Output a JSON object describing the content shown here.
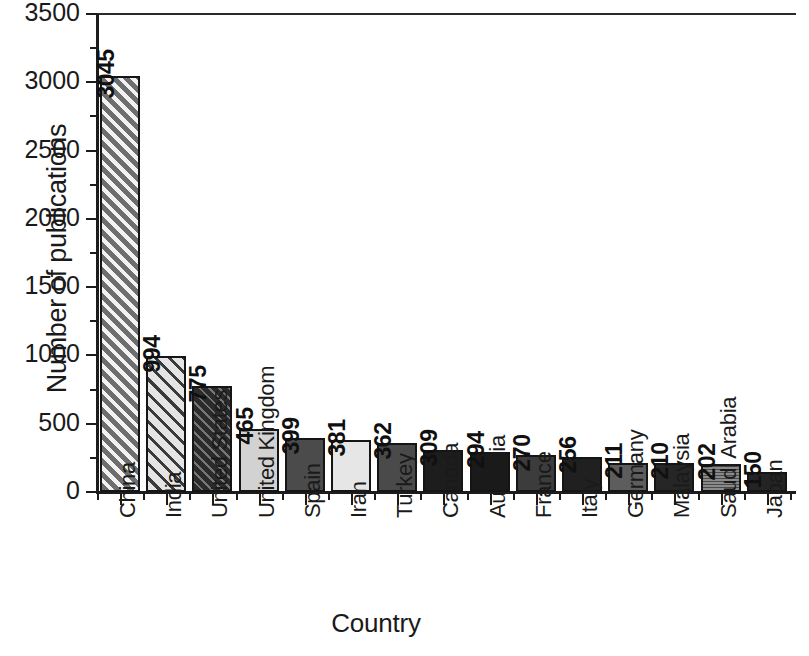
{
  "chart_data": {
    "type": "bar",
    "title": "",
    "xlabel": "Country",
    "ylabel": "Number of publications",
    "categories": [
      "China",
      "India",
      "United States",
      "United Kingdom",
      "Spain",
      "Iran",
      "Turkey",
      "Canada",
      "Australia",
      "France",
      "Italy",
      "Germany",
      "Malaysia",
      "Saudi Arabia",
      "Japan"
    ],
    "values": [
      3045,
      994,
      775,
      465,
      399,
      381,
      362,
      309,
      294,
      270,
      256,
      211,
      210,
      202,
      150
    ],
    "value_labels": [
      "3045",
      "994",
      "775",
      "465",
      "399",
      "381",
      "362",
      "309",
      "294",
      "270",
      "256",
      "211",
      "210",
      "202",
      "150"
    ],
    "ylim": [
      0,
      3500
    ],
    "ytick_labels": [
      "0",
      "500",
      "1000",
      "1500",
      "2000",
      "2500",
      "3000",
      "3500"
    ],
    "ytick_values": [
      0,
      500,
      1000,
      1500,
      2000,
      2500,
      3000,
      3500
    ],
    "yminor_step": 250,
    "grid": false,
    "legend": null,
    "bar_styles": [
      {
        "fill": "#6e6e6e",
        "pattern": "diagonal-hatch-light"
      },
      {
        "fill": "#e4e4e4",
        "pattern": "diagonal-hatch-dark"
      },
      {
        "fill": "#2b2b2b",
        "pattern": "diamond-crosshatch"
      },
      {
        "fill": "#d2d2d2",
        "pattern": "solid"
      },
      {
        "fill": "#4b4b4b",
        "pattern": "solid"
      },
      {
        "fill": "#e6e6e6",
        "pattern": "solid"
      },
      {
        "fill": "#4a4a4a",
        "pattern": "solid"
      },
      {
        "fill": "#1d1d1d",
        "pattern": "solid"
      },
      {
        "fill": "#1a1a1a",
        "pattern": "solid"
      },
      {
        "fill": "#3c3c3c",
        "pattern": "solid"
      },
      {
        "fill": "#202020",
        "pattern": "solid"
      },
      {
        "fill": "#5d5d5d",
        "pattern": "solid"
      },
      {
        "fill": "#262626",
        "pattern": "solid"
      },
      {
        "fill": "#8a8a8a",
        "pattern": "fine-grid"
      },
      {
        "fill": "#242424",
        "pattern": "solid"
      }
    ],
    "axis_color": "#1c1c1c",
    "background": "#ffffff"
  }
}
